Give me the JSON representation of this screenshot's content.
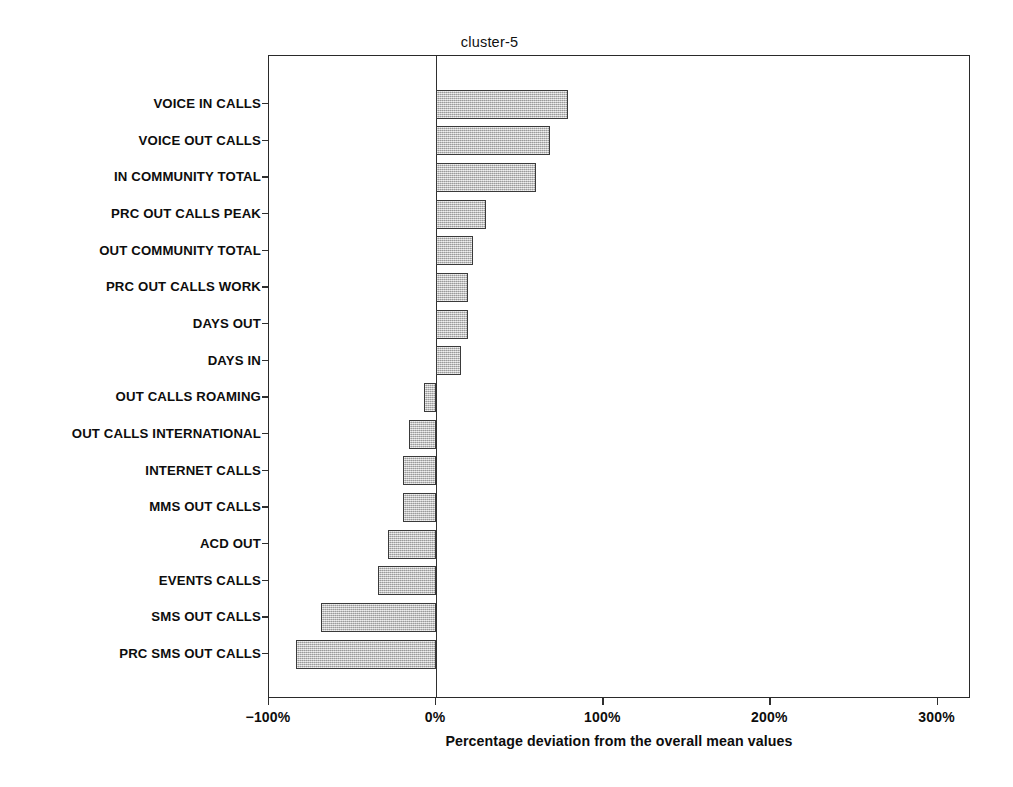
{
  "chart_data": {
    "type": "bar",
    "orientation": "horizontal",
    "title": "cluster-5",
    "xlabel": "Percentage deviation from the overall mean values",
    "ylabel": "",
    "xlim": [
      -100,
      320
    ],
    "xticks": [
      -100,
      0,
      100,
      200,
      300
    ],
    "xtick_labels": [
      "−100%",
      "0%",
      "100%",
      "200%",
      "300%"
    ],
    "grid": false,
    "legend": false,
    "zero_reference_line": true,
    "value_unit": "%",
    "categories": [
      "VOICE IN CALLS",
      "VOICE OUT CALLS",
      "IN COMMUNITY TOTAL",
      "PRC OUT CALLS PEAK",
      "OUT COMMUNITY TOTAL",
      "PRC OUT CALLS WORK",
      "DAYS OUT",
      "DAYS IN",
      "OUT CALLS ROAMING",
      "OUT CALLS INTERNATIONAL",
      "INTERNET CALLS",
      "MMS OUT CALLS",
      "ACD OUT",
      "EVENTS CALLS",
      "SMS OUT CALLS",
      "PRC SMS OUT CALLS"
    ],
    "values": [
      79,
      68,
      60,
      30,
      22,
      19,
      19,
      15,
      -7,
      -16,
      -20,
      -20,
      -29,
      -35,
      -69,
      -84
    ],
    "series": [
      {
        "name": "cluster-5",
        "values": [
          79,
          68,
          60,
          30,
          22,
          19,
          19,
          15,
          -7,
          -16,
          -20,
          -20,
          -29,
          -35,
          -69,
          -84
        ]
      }
    ],
    "bar_fill_color": "#bdbdbd",
    "bar_edge_color": "#3a3a3a",
    "axis_color": "#2a2a2a",
    "background_color": "#ffffff"
  }
}
